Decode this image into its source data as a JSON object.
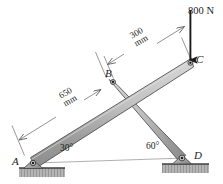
{
  "figure": {
    "background_color": "#ffffff",
    "member_fill": "#b9b9b9",
    "member_stroke": "#4a4a4a",
    "ground_fill": "#9a9a9a",
    "dimension_color": "#5a5a5a",
    "force_color": "#1b1b1b"
  },
  "points": {
    "A": {
      "label": "A",
      "x": 33,
      "y": 163,
      "support": "pin"
    },
    "B": {
      "label": "B",
      "x": 113,
      "y": 82,
      "support": "joint"
    },
    "C": {
      "label": "C",
      "x": 190,
      "y": 63,
      "support": "free-end"
    },
    "D": {
      "label": "D",
      "x": 182,
      "y": 158,
      "support": "pin"
    }
  },
  "angles": [
    {
      "id": "angle-at-a",
      "label": "30°",
      "vertex": "A",
      "value": 30
    },
    {
      "id": "angle-at-d",
      "label": "60°",
      "vertex": "D",
      "value": 60
    }
  ],
  "dimensions": [
    {
      "id": "dim-ab",
      "value": "650",
      "unit": "mm",
      "from": "A",
      "to": "B",
      "orientation": "parallel-to-beam"
    },
    {
      "id": "dim-bc",
      "value": "300",
      "unit": "mm",
      "from": "B",
      "to": "C",
      "orientation": "parallel-to-beam"
    }
  ],
  "loads": [
    {
      "id": "load-at-c",
      "label": "800 N",
      "magnitude": 800,
      "unit": "N",
      "direction": "down",
      "applied_at": "C"
    }
  ],
  "members": [
    {
      "id": "member-ac",
      "from": "A",
      "to": "C",
      "type": "beam"
    },
    {
      "id": "member-bd",
      "from": "B",
      "to": "D",
      "type": "strut"
    }
  ],
  "ground": {
    "left_base_label": "hatched-ground-left",
    "right_base_label": "hatched-ground-right"
  }
}
